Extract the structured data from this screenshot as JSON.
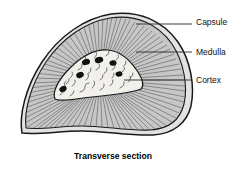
{
  "figure": {
    "caption": "Transverse section",
    "background_color": "#ffffff",
    "outline_color": "#1a1a1a",
    "cortex_fill": "#c8c8c8",
    "medulla_fill": "#f2f0ea",
    "capsule_fill": "#e2e2e2",
    "nucleus_color": "#111111",
    "text_color": "#101010"
  },
  "labels": [
    {
      "id": "capsule",
      "text": "Capsule",
      "text_x": 196,
      "text_y": 25,
      "leader_x1": 136,
      "leader_y1": 24,
      "leader_x2": 192,
      "leader_y2": 24
    },
    {
      "id": "medulla",
      "text": "Medulla",
      "text_x": 196,
      "text_y": 55,
      "leader_x1": 136,
      "leader_y1": 52,
      "leader_x2": 192,
      "leader_y2": 52
    },
    {
      "id": "cortex",
      "text": "Cortex",
      "text_x": 196,
      "text_y": 83,
      "leader_x1": 124,
      "leader_y1": 80,
      "leader_x2": 192,
      "leader_y2": 80
    }
  ],
  "structures": [
    {
      "id": "capsule",
      "name": "Capsule",
      "description": "outer double-line fibrous band enclosing the section"
    },
    {
      "id": "cortex",
      "name": "Cortex",
      "description": "radially striated gray outer zone"
    },
    {
      "id": "medulla",
      "name": "Medulla",
      "description": "pale inner region with dark oval nuclei and squiggle texture"
    }
  ],
  "nuclei": [
    {
      "cx": 86,
      "cy": 62,
      "rx": 4.1,
      "ry": 3.0,
      "rot": -18
    },
    {
      "cx": 99,
      "cy": 60,
      "rx": 4.3,
      "ry": 3.0,
      "rot": -12
    },
    {
      "cx": 113,
      "cy": 63,
      "rx": 3.6,
      "ry": 2.7,
      "rot": -8
    },
    {
      "cx": 80,
      "cy": 75,
      "rx": 3.9,
      "ry": 2.9,
      "rot": -22
    },
    {
      "cx": 119,
      "cy": 74,
      "rx": 3.5,
      "ry": 2.6,
      "rot": -10
    },
    {
      "cx": 63,
      "cy": 89,
      "rx": 3.8,
      "ry": 2.8,
      "rot": -28
    }
  ]
}
